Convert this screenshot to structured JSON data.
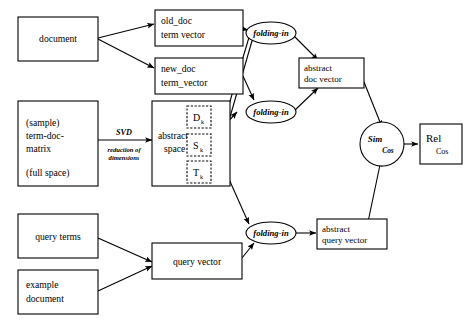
{
  "diagram": {
    "background_color": "#ffffff",
    "stroke_color": "#000000",
    "nodes": {
      "document": {
        "label": "document",
        "shape": "rect"
      },
      "old_doc": {
        "line1": "old_doc",
        "line2": "term vector",
        "shape": "rect"
      },
      "new_doc": {
        "line1": "new_doc",
        "line2": "term_vector",
        "shape": "rect"
      },
      "term_doc_matrix": {
        "line1": "(sample)",
        "line2": "term-doc-",
        "line3": "matrix",
        "line4": "(full space)",
        "shape": "rect"
      },
      "abstract_space": {
        "line1": "abstract",
        "line2": "space",
        "shape": "rect"
      },
      "matrix_d": {
        "symbol": "D",
        "subscript": "k",
        "shape": "dashed-rect"
      },
      "matrix_s": {
        "symbol": "S",
        "subscript": "k",
        "shape": "dashed-rect"
      },
      "matrix_t": {
        "symbol": "T",
        "subscript": "k",
        "shape": "dashed-rect"
      },
      "query_terms": {
        "label": "query terms",
        "shape": "rect"
      },
      "example_document": {
        "line1": "example",
        "line2": "document",
        "shape": "rect"
      },
      "query_vector": {
        "label": "query vector",
        "shape": "rect"
      },
      "folding_in_top": {
        "label": "folding-in",
        "shape": "ellipse"
      },
      "folding_in_mid": {
        "label": "folding-in",
        "shape": "ellipse"
      },
      "folding_in_bottom": {
        "label": "folding-in",
        "shape": "ellipse"
      },
      "abstract_doc_vector": {
        "line1": "abstract",
        "line2": "doc vector",
        "shape": "rect"
      },
      "abstract_query_vector": {
        "line1": "abstract",
        "line2": "query vector",
        "shape": "rect"
      },
      "sim_cos": {
        "line1": "Sim",
        "line2": "Cos",
        "shape": "circle"
      },
      "rel_cos": {
        "line1": "Rel",
        "line2": "Cos",
        "shape": "rect"
      }
    },
    "edge_labels": {
      "svd": "SVD",
      "reduction_line1": "reduction of",
      "reduction_line2": "dimensions"
    }
  }
}
